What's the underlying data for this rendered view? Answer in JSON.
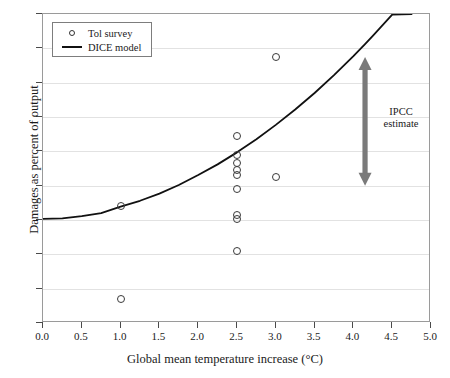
{
  "figure": {
    "background_color": "#ffffff",
    "curve_color": "#111111",
    "marker_color": "#3a3a3a",
    "grid_color": "#e2e2e2",
    "arrow_color": "#7a7a7a"
  },
  "legend": {
    "position": "top-left",
    "entries": [
      {
        "label": "Tol survey",
        "marker": "circle-open",
        "icon": "circle-marker-icon"
      },
      {
        "label": "DICE model",
        "marker": "line",
        "icon": "line-marker-icon"
      }
    ]
  },
  "annotations": [
    {
      "name": "ipcc-estimate",
      "text_line1": "IPCC",
      "text_line2": "estimate",
      "arrow": "double-headed-vertical",
      "x": 4.15,
      "y_top": 4.75,
      "y_bottom": 1.0,
      "color": "#7a7a7a"
    }
  ],
  "chart_data": {
    "type": "scatter",
    "title": "",
    "subtitle": "",
    "xlabel": "Global mean temperature increase (°C)",
    "ylabel": "Damages as percent of output",
    "xlim": [
      0.0,
      5.0
    ],
    "ylim": [
      -3,
      6
    ],
    "xticks": [
      "0.0",
      "0.5",
      "1.0",
      "1.5",
      "2.0",
      "2.5",
      "3.0",
      "3.5",
      "4.0",
      "4.5",
      "5.0"
    ],
    "xtick_values": [
      0.0,
      0.5,
      1.0,
      1.5,
      2.0,
      2.5,
      3.0,
      3.5,
      4.0,
      4.5,
      5.0
    ],
    "yticks": [
      "6",
      "5",
      "4",
      "3",
      "2",
      "1",
      "0",
      "–1",
      "–2",
      "–3"
    ],
    "ytick_values": [
      6,
      5,
      4,
      3,
      2,
      1,
      0,
      -1,
      -2,
      -3
    ],
    "grid": true,
    "grid_axis": "y",
    "legend_position": "upper left",
    "series": [
      {
        "name": "Tol survey",
        "type": "scatter",
        "marker": "circle-open",
        "points": [
          {
            "x": 1.0,
            "y": 0.4
          },
          {
            "x": 1.0,
            "y": -2.3
          },
          {
            "x": 2.5,
            "y": 2.45
          },
          {
            "x": 2.5,
            "y": 1.9
          },
          {
            "x": 2.5,
            "y": 1.65
          },
          {
            "x": 2.5,
            "y": 1.45
          },
          {
            "x": 2.5,
            "y": 1.3
          },
          {
            "x": 2.5,
            "y": 0.9
          },
          {
            "x": 2.5,
            "y": 0.15
          },
          {
            "x": 2.5,
            "y": 0.02
          },
          {
            "x": 2.5,
            "y": -0.9
          },
          {
            "x": 3.0,
            "y": 4.75
          },
          {
            "x": 3.0,
            "y": 1.25
          }
        ]
      },
      {
        "name": "DICE model",
        "type": "line",
        "formula_note": "damages ≈ 0.26 · T^1.85",
        "x": [
          0.0,
          0.25,
          0.5,
          0.75,
          1.0,
          1.25,
          1.5,
          1.75,
          2.0,
          2.25,
          2.5,
          2.75,
          3.0,
          3.25,
          3.5,
          3.75,
          4.0,
          4.15,
          4.25,
          4.5,
          4.75
        ],
        "values": [
          0.03,
          0.05,
          0.11,
          0.2,
          0.39,
          0.56,
          0.77,
          1.02,
          1.31,
          1.62,
          1.97,
          2.35,
          2.77,
          3.22,
          3.7,
          4.22,
          4.77,
          5.12,
          5.36,
          5.98,
          6.0
        ]
      }
    ]
  }
}
